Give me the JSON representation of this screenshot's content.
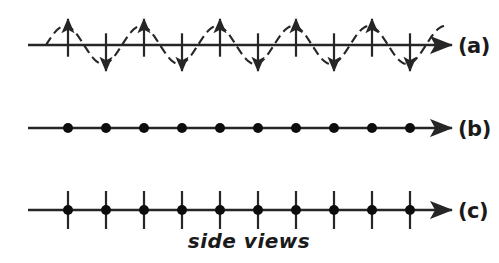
{
  "figure": {
    "caption": "side views",
    "background_color": "#ffffff",
    "ink_color": "#262626",
    "width": 499,
    "height": 263,
    "rows": [
      {
        "id": "a",
        "label": "(a)",
        "label_x": 458,
        "description": "transverse wave with alternating up and down displacement arrows along a dashed sine curve",
        "axis_y": 45,
        "axis_x_start": 28,
        "axis_x_end": 452,
        "arrow_count": 10,
        "arrow_first_x": 68,
        "arrow_spacing": 38,
        "arrow_length": 26,
        "wave_amplitude": 19,
        "wave_period": 76,
        "wave_x_start": 46,
        "wave_x_end": 446,
        "wave_dashed": true,
        "marker_type": "alternating-arrows"
      },
      {
        "id": "b",
        "label": "(b)",
        "label_x": 458,
        "description": "longitudinal view showing evenly spaced dots on the axis",
        "axis_y": 128,
        "axis_x_start": 28,
        "axis_x_end": 452,
        "dot_count": 10,
        "dot_first_x": 68,
        "dot_spacing": 38,
        "dot_radius": 5,
        "marker_type": "dots"
      },
      {
        "id": "c",
        "label": "(c)",
        "label_x": 458,
        "description": "evenly spaced dots on the axis each crossed by a vertical bar",
        "axis_y": 210,
        "axis_x_start": 28,
        "axis_x_end": 452,
        "dot_count": 10,
        "dot_first_x": 68,
        "dot_spacing": 38,
        "dot_radius": 5,
        "bar_half_length": 19,
        "marker_type": "dots-with-bars"
      }
    ],
    "caption_x": 249,
    "caption_y": 248
  }
}
